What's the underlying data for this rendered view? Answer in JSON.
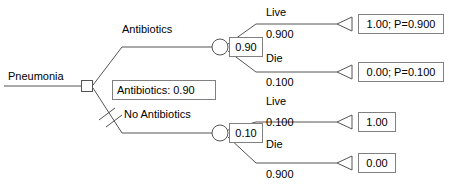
{
  "diagram": {
    "type": "decision-tree",
    "root_label": "Pneumonia",
    "policy_label": "Antibiotics: 0.90",
    "colors": {
      "line": "#555555",
      "box_border": "#808080",
      "text": "#000000",
      "background": "#ffffff"
    },
    "decision_branches": [
      {
        "label": "Antibiotics",
        "chosen": true,
        "expected_value": "0.90",
        "outcomes": [
          {
            "label": "Live",
            "probability": "0.900",
            "payoff": "1.00; P=0.900"
          },
          {
            "label": "Die",
            "probability": "0.100",
            "payoff": "0.00; P=0.100"
          }
        ]
      },
      {
        "label": "No Antibiotics",
        "chosen": false,
        "expected_value": "0.10",
        "outcomes": [
          {
            "label": "Live",
            "probability": "0.100",
            "payoff": "1.00"
          },
          {
            "label": "Die",
            "probability": "0.900",
            "payoff": "0.00"
          }
        ]
      }
    ]
  }
}
